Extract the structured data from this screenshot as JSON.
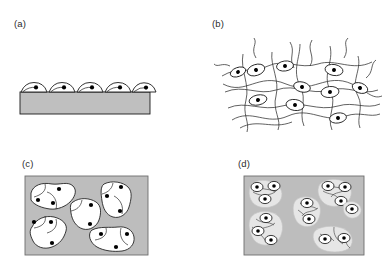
{
  "figure": {
    "type": "schematic-diagram",
    "background_color": "#ffffff",
    "width": 392,
    "height": 277
  },
  "style": {
    "substrate_fill": "#bfbfbf",
    "matrix_fill": "#bdbdbd",
    "cell_fill": "#ffffff",
    "cell_fill_soft": "#e6e6e6",
    "outline_color": "#1a1a1a",
    "fiber_color": "#2e2e2e",
    "nucleus_color": "#000000",
    "label_color": "#2b2b2b"
  },
  "panels": [
    {
      "id": "a",
      "label": "(a)",
      "label_x": 14,
      "label_y": 18,
      "description": "flattened cells spread on a flat rigid substrate slab",
      "substrate": {
        "x": 20,
        "y": 92,
        "width": 130,
        "height": 22
      },
      "cell_count": 5,
      "cells": [
        {
          "cx": 34,
          "cy": 91,
          "rx": 13,
          "ry": 6.5,
          "nucleus_dx": 2.0
        },
        {
          "cx": 62,
          "cy": 91,
          "rx": 13,
          "ry": 6.5,
          "nucleus_dx": 2.0
        },
        {
          "cx": 90,
          "cy": 91,
          "rx": 13,
          "ry": 6.5,
          "nucleus_dx": 2.0
        },
        {
          "cx": 118,
          "cy": 91,
          "rx": 13,
          "ry": 6.5,
          "nucleus_dx": 2.0
        },
        {
          "cx": 143,
          "cy": 91,
          "rx": 12,
          "ry": 6.5,
          "nucleus_dx": 2.0
        }
      ]
    },
    {
      "id": "b",
      "label": "(b)",
      "label_x": 212,
      "label_y": 18,
      "description": "elongated cells embedded within a loose fibrous network",
      "cell_count": 10,
      "cells": [
        {
          "cx": 256,
          "cy": 70,
          "rx": 9,
          "ry": 5.5,
          "rot": -18
        },
        {
          "cx": 285,
          "cy": 66,
          "rx": 8.5,
          "ry": 5,
          "rot": -8
        },
        {
          "cx": 334,
          "cy": 70,
          "rx": 9,
          "ry": 5.5,
          "rot": 10
        },
        {
          "cx": 302,
          "cy": 87,
          "rx": 8.5,
          "ry": 5,
          "rot": 14
        },
        {
          "cx": 330,
          "cy": 92,
          "rx": 9,
          "ry": 5.5,
          "rot": -6
        },
        {
          "cx": 360,
          "cy": 88,
          "rx": 8,
          "ry": 5,
          "rot": 20
        },
        {
          "cx": 258,
          "cy": 100,
          "rx": 9,
          "ry": 5,
          "rot": -12
        },
        {
          "cx": 295,
          "cy": 105,
          "rx": 9,
          "ry": 5.5,
          "rot": 8
        },
        {
          "cx": 338,
          "cy": 118,
          "rx": 8.5,
          "ry": 5,
          "rot": -10
        },
        {
          "cx": 238,
          "cy": 72,
          "rx": 8,
          "ry": 4.5,
          "rot": -20
        }
      ]
    },
    {
      "id": "c",
      "label": "(c)",
      "label_x": 22,
      "label_y": 158,
      "description": "large multicellular colonies spreading inside a soft gel matrix",
      "matrix": {
        "x": 25,
        "y": 176,
        "width": 123,
        "height": 79
      },
      "colony_count": 6,
      "colonies": [
        {
          "name": "top-left",
          "nuclei": 3
        },
        {
          "name": "top-right",
          "nuclei": 3
        },
        {
          "name": "center",
          "nuclei": 2
        },
        {
          "name": "bottom-left",
          "nuclei": 3
        },
        {
          "name": "bottom-right",
          "nuclei": 3
        },
        {
          "name": "lower-center",
          "nuclei": 1
        }
      ]
    },
    {
      "id": "d",
      "label": "(d)",
      "label_x": 238,
      "label_y": 158,
      "description": "rounded cells in small clusters with fine fibrillar strands in a dense matrix",
      "matrix": {
        "x": 244,
        "y": 176,
        "width": 120,
        "height": 79
      },
      "cluster_count": 6,
      "clusters": [
        {
          "name": "top-left",
          "cells": 3
        },
        {
          "name": "top-right",
          "cells": 3
        },
        {
          "name": "center",
          "cells": 2
        },
        {
          "name": "bottom-left",
          "cells": 3
        },
        {
          "name": "bottom-right",
          "cells": 2
        },
        {
          "name": "right-mid",
          "cells": 1
        }
      ]
    }
  ]
}
